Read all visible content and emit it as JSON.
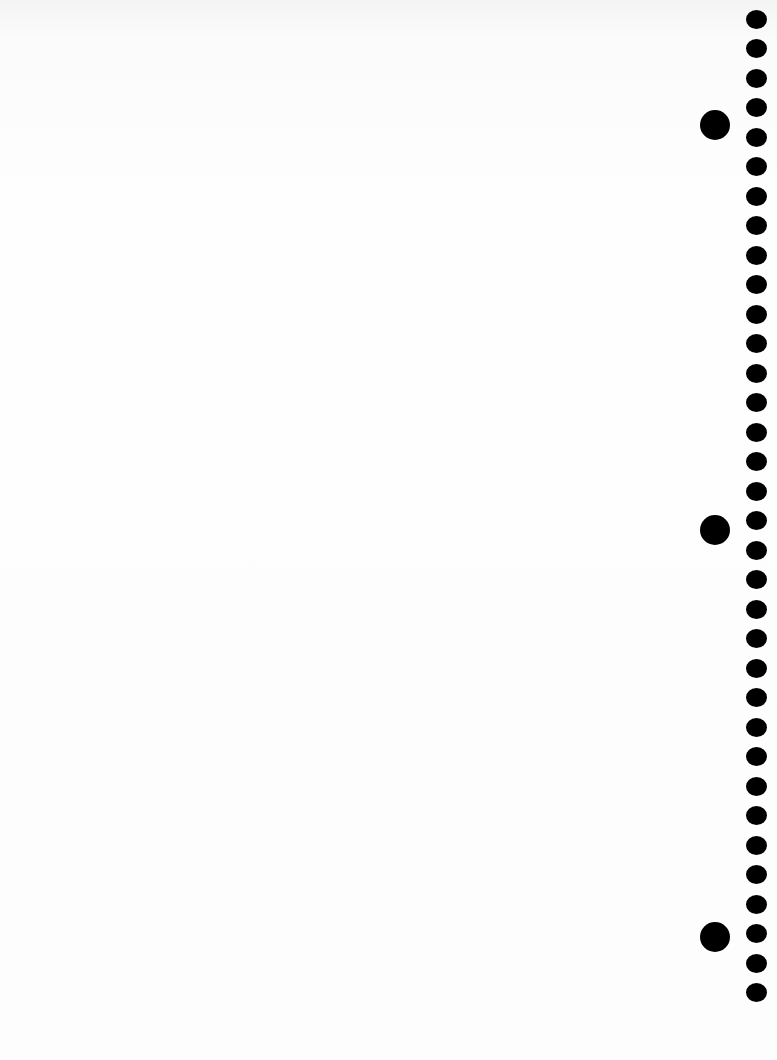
{
  "page": {
    "background_color": "#fdfdfd",
    "hole_color": "#000000"
  },
  "holes": {
    "small": {
      "count": 34,
      "center_x": 756,
      "start_y": 19,
      "spacing": 29.5
    },
    "large": [
      {
        "center_x": 715,
        "center_y": 125
      },
      {
        "center_x": 715,
        "center_y": 530
      },
      {
        "center_x": 715,
        "center_y": 937
      }
    ]
  }
}
